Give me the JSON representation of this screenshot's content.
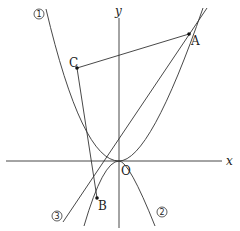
{
  "labels": {
    "x_axis": "x",
    "y_axis": "y",
    "origin": "O",
    "point_A": "A",
    "point_B": "B",
    "point_C": "C",
    "curve_1": "1",
    "curve_2": "2",
    "line_3": "3"
  },
  "colors": {
    "stroke": "#333333",
    "background": "#ffffff"
  }
}
